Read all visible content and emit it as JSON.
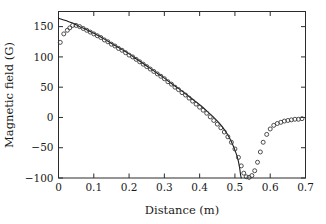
{
  "chart_data": {
    "type": "scatter",
    "title": "",
    "subtitle": "",
    "xlabel": "Distance (m)",
    "ylabel": "Magnetic field (G)",
    "xlim": [
      0.0,
      0.7
    ],
    "ylim": [
      -100,
      175
    ],
    "xticks": [
      0,
      0.1,
      0.2,
      0.3,
      0.4,
      0.5,
      0.6,
      0.7
    ],
    "xtick_labels": [
      "0",
      "0.1",
      "0.2",
      "0.3",
      "0.4",
      "0.5",
      "0.6",
      "0.7"
    ],
    "yticks": [
      -100,
      -50,
      0,
      50,
      100,
      150
    ],
    "ytick_labels": [
      "−100",
      "−50",
      "0",
      "50",
      "100",
      "150"
    ],
    "grid": false,
    "legend": null,
    "tick_direction": "in",
    "series": [
      {
        "name": "measured data",
        "style": "open-circle-markers",
        "marker": "o",
        "color": "#3a3a3a",
        "points": [
          [
            0.005,
            124
          ],
          [
            0.015,
            138
          ],
          [
            0.025,
            144
          ],
          [
            0.032,
            148
          ],
          [
            0.04,
            152
          ],
          [
            0.05,
            152
          ],
          [
            0.06,
            150
          ],
          [
            0.07,
            147
          ],
          [
            0.08,
            144
          ],
          [
            0.09,
            141
          ],
          [
            0.1,
            138
          ],
          [
            0.11,
            135
          ],
          [
            0.12,
            132
          ],
          [
            0.13,
            128
          ],
          [
            0.14,
            125
          ],
          [
            0.15,
            121
          ],
          [
            0.16,
            118
          ],
          [
            0.17,
            114
          ],
          [
            0.18,
            111
          ],
          [
            0.19,
            107
          ],
          [
            0.2,
            103
          ],
          [
            0.21,
            100
          ],
          [
            0.22,
            96
          ],
          [
            0.23,
            92
          ],
          [
            0.24,
            88
          ],
          [
            0.25,
            84
          ],
          [
            0.26,
            80
          ],
          [
            0.27,
            76
          ],
          [
            0.28,
            72
          ],
          [
            0.29,
            68
          ],
          [
            0.3,
            64
          ],
          [
            0.31,
            59
          ],
          [
            0.32,
            55
          ],
          [
            0.33,
            50
          ],
          [
            0.34,
            46
          ],
          [
            0.35,
            41
          ],
          [
            0.36,
            37
          ],
          [
            0.37,
            32
          ],
          [
            0.38,
            27
          ],
          [
            0.39,
            22
          ],
          [
            0.4,
            17
          ],
          [
            0.41,
            12
          ],
          [
            0.42,
            7
          ],
          [
            0.43,
            1
          ],
          [
            0.44,
            -5
          ],
          [
            0.45,
            -11
          ],
          [
            0.46,
            -17
          ],
          [
            0.47,
            -24
          ],
          [
            0.48,
            -32
          ],
          [
            0.49,
            -41
          ],
          [
            0.5,
            -52
          ],
          [
            0.51,
            -66
          ],
          [
            0.518,
            -80
          ],
          [
            0.525,
            -92
          ],
          [
            0.532,
            -98
          ],
          [
            0.54,
            -99
          ],
          [
            0.548,
            -96
          ],
          [
            0.556,
            -88
          ],
          [
            0.564,
            -74
          ],
          [
            0.572,
            -57
          ],
          [
            0.58,
            -41
          ],
          [
            0.59,
            -28
          ],
          [
            0.6,
            -19
          ],
          [
            0.61,
            -13
          ],
          [
            0.62,
            -10
          ],
          [
            0.63,
            -8
          ],
          [
            0.64,
            -6
          ],
          [
            0.65,
            -5
          ],
          [
            0.66,
            -4
          ],
          [
            0.67,
            -3
          ],
          [
            0.68,
            -3
          ],
          [
            0.69,
            -2
          ]
        ]
      },
      {
        "name": "model fit",
        "style": "solid-line",
        "color": "#1a1a1a",
        "points": [
          [
            0.0,
            164
          ],
          [
            0.02,
            160
          ],
          [
            0.04,
            156
          ],
          [
            0.05,
            153
          ],
          [
            0.06,
            150
          ],
          [
            0.08,
            145
          ],
          [
            0.1,
            139
          ],
          [
            0.12,
            133
          ],
          [
            0.14,
            126
          ],
          [
            0.16,
            119
          ],
          [
            0.18,
            112
          ],
          [
            0.2,
            105
          ],
          [
            0.22,
            97
          ],
          [
            0.24,
            89
          ],
          [
            0.26,
            81
          ],
          [
            0.28,
            73
          ],
          [
            0.3,
            65
          ],
          [
            0.32,
            56
          ],
          [
            0.34,
            48
          ],
          [
            0.36,
            39
          ],
          [
            0.38,
            30
          ],
          [
            0.4,
            21
          ],
          [
            0.42,
            11
          ],
          [
            0.44,
            0
          ],
          [
            0.455,
            -9
          ],
          [
            0.47,
            -20
          ],
          [
            0.48,
            -29
          ],
          [
            0.49,
            -40
          ],
          [
            0.5,
            -54
          ],
          [
            0.508,
            -68
          ],
          [
            0.513,
            -82
          ],
          [
            0.516,
            -95
          ],
          [
            0.518,
            -100
          ]
        ]
      }
    ],
    "annotations": []
  },
  "figure": {
    "background_color": "#ffffff",
    "axis_color": "#2b2b2b",
    "data_color": "#3a3a3a",
    "curve_color": "#1a1a1a"
  }
}
